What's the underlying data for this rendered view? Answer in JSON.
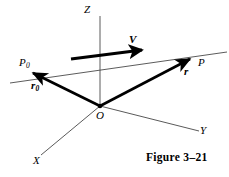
{
  "figure": {
    "caption": "Figure 3–21",
    "background_color": "#ffffff",
    "ink_color": "#000000",
    "axis_line_color": "#555555",
    "width": 229,
    "height": 177
  },
  "axes": [
    {
      "name": "z-axis",
      "label": "Z",
      "from": [
        100,
        16
      ],
      "to": [
        100,
        108
      ]
    },
    {
      "name": "x-axis",
      "label": "X",
      "from": [
        100,
        106
      ],
      "to": [
        41,
        155
      ]
    },
    {
      "name": "y-axis",
      "label": "Y",
      "from": [
        100,
        106
      ],
      "to": [
        199,
        131
      ]
    }
  ],
  "points": [
    {
      "name": "origin",
      "label": "O",
      "label_sub": "",
      "at": [
        100,
        106
      ]
    },
    {
      "name": "point-p0",
      "label": "P",
      "label_sub": "0",
      "at": [
        29,
        77
      ]
    },
    {
      "name": "point-p",
      "label": "P",
      "label_sub": "",
      "at": [
        194,
        59
      ]
    }
  ],
  "vectors": [
    {
      "name": "position-vector-r0",
      "label": "r",
      "label_sub": "0",
      "from": [
        100,
        106
      ],
      "to": [
        30,
        71
      ],
      "style": "bold-arrow"
    },
    {
      "name": "position-vector-r",
      "label": "r",
      "label_sub": "",
      "from": [
        100,
        106
      ],
      "to": [
        193,
        57
      ],
      "style": "bold-arrow"
    },
    {
      "name": "velocity-vector-v",
      "label": "V",
      "label_sub": "",
      "from": [
        71,
        59
      ],
      "to": [
        147,
        49
      ],
      "style": "thick-arrow"
    }
  ],
  "lines": [
    {
      "name": "trajectory-line",
      "from": [
        10,
        83
      ],
      "to": [
        227,
        52
      ],
      "style": "thin"
    }
  ],
  "labels": {
    "z": "Z",
    "x": "X",
    "y": "Y",
    "o": "O",
    "p0_base": "P",
    "p0_sub": "0",
    "p": "P",
    "r0_base": "r",
    "r0_sub": "0",
    "r": "r",
    "v": "V"
  }
}
